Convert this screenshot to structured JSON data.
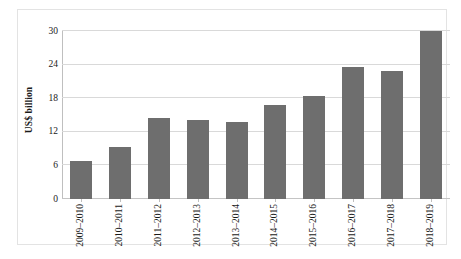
{
  "chart_data": {
    "type": "bar",
    "title": "",
    "xlabel": "",
    "ylabel": "US$ billion",
    "categories": [
      "2009–2010",
      "2010–2011",
      "2011–2012",
      "2012–2013",
      "2013–2014",
      "2014–2015",
      "2015–2016",
      "2016–2017",
      "2017–2018",
      "2018–2019"
    ],
    "values": [
      6.8,
      9.3,
      14.5,
      14.1,
      13.7,
      16.8,
      18.4,
      23.5,
      22.8,
      30.0
    ],
    "ylim": [
      0,
      30
    ],
    "yticks": [
      0,
      6,
      12,
      18,
      24,
      30
    ],
    "ytick_labels": [
      "0",
      "6",
      "12",
      "18",
      "24",
      "30"
    ],
    "grid": true,
    "legend": null,
    "bar_color": "#6e6e6e",
    "grid_color": "#d9d9d9",
    "frame_color": "#e3e3e3",
    "background": "#ffffff"
  }
}
